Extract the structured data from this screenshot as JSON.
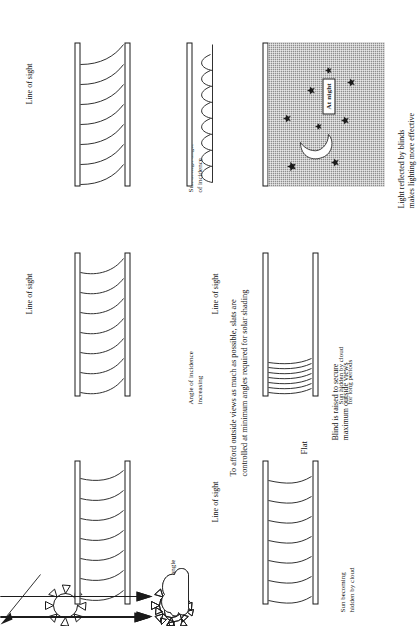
{
  "figure": {
    "orientation": "rotated-90-ccw",
    "ink_color": "#1a1a1a",
    "night_fill": "#8d8d8d",
    "panels": [
      {
        "id": "sun-high",
        "condition_label": "Sun at high angle\nof incidence",
        "sight_label": "Line of sight",
        "slat_state": "steeply-tilted"
      },
      {
        "id": "angle-increasing",
        "condition_label": "Angle of incidence\nincreasing",
        "sight_label": "Line of sight",
        "slat_state": "tilted"
      },
      {
        "id": "sun-low",
        "condition_label": "Sun at low angle\nof incidence",
        "sight_label": "",
        "slat_state": "shallow-tilted"
      },
      {
        "id": "at-night",
        "condition_label": "",
        "sight_label": "",
        "badge": "At night",
        "note": "Light reflected by blinds\nmakes lighting more effective",
        "slat_state": "reflective-up"
      },
      {
        "id": "sun-hidden-long",
        "condition_label": "Sun hidden by cloud\nfor long periods",
        "sight_label": "Line of sight",
        "note": "Blind is raised to secure\nmaximum outside views",
        "slat_state": "raised-stacked"
      },
      {
        "id": "sun-becoming-hidden",
        "condition_label": "Sun becoming\nhidden by cloud",
        "sight_label": "Line of sight",
        "note": "Flat",
        "slat_state": "flat-open"
      }
    ],
    "center_caption": "To afford outside views as much as possible, slats are\ncontrolled at minimum angles required for solar shading"
  }
}
